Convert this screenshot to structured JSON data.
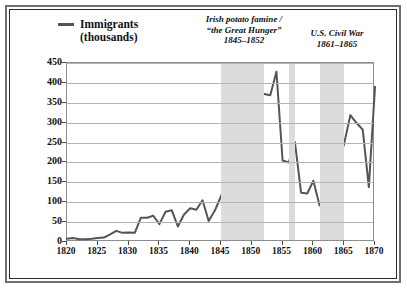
{
  "legend": {
    "label": "Immigrants",
    "sublabel": "(thousands)",
    "swatch_color": "#555555"
  },
  "annotations": [
    {
      "id": "famine",
      "line1": "Irish potato famine /",
      "line2": "“the Great Hunger”",
      "line3": "1845–1852"
    },
    {
      "id": "civilwar",
      "line1": "U.S. Civil War",
      "line2": "1861–1865"
    },
    {
      "id": "german",
      "line1": "German revolutions",
      "line2": "1848–1849"
    },
    {
      "id": "recession",
      "line1": "U.S.",
      "line2": "economic",
      "line3": "recession",
      "line4": "1856–1857"
    }
  ],
  "chart_data": {
    "type": "line",
    "title": "",
    "xlabel": "",
    "ylabel": "Immigrants (thousands)",
    "xlim": [
      1820,
      1870
    ],
    "ylim": [
      0,
      450
    ],
    "xticks": [
      1820,
      1825,
      1830,
      1835,
      1840,
      1845,
      1850,
      1855,
      1860,
      1865,
      1870
    ],
    "yticks": [
      0,
      50,
      100,
      150,
      200,
      250,
      300,
      350,
      400,
      450
    ],
    "grid": "horizontal",
    "legend_position": "top-left",
    "line_color": "#555555",
    "band_color": "#dcdcdc",
    "shaded_bands": [
      {
        "label": "Irish potato famine / the Great Hunger",
        "start": 1845,
        "end": 1852
      },
      {
        "label": "U.S. economic recession",
        "start": 1856,
        "end": 1857
      },
      {
        "label": "U.S. Civil War",
        "start": 1861,
        "end": 1865
      }
    ],
    "x": [
      1820,
      1821,
      1822,
      1823,
      1824,
      1825,
      1826,
      1827,
      1828,
      1829,
      1830,
      1831,
      1832,
      1833,
      1834,
      1835,
      1836,
      1837,
      1838,
      1839,
      1840,
      1841,
      1842,
      1843,
      1844,
      1845,
      1846,
      1847,
      1848,
      1849,
      1850,
      1851,
      1852,
      1853,
      1854,
      1855,
      1856,
      1857,
      1858,
      1859,
      1860,
      1861,
      1862,
      1863,
      1864,
      1865,
      1866,
      1867,
      1868,
      1869,
      1870
    ],
    "values": [
      8,
      10,
      7,
      7,
      8,
      10,
      11,
      19,
      28,
      23,
      24,
      23,
      61,
      61,
      66,
      45,
      76,
      80,
      39,
      69,
      85,
      81,
      105,
      53,
      79,
      115,
      155,
      235,
      228,
      300,
      312,
      380,
      372,
      369,
      428,
      205,
      200,
      251,
      124,
      122,
      154,
      92,
      92,
      176,
      193,
      248,
      319,
      299,
      283,
      138,
      390
    ]
  }
}
